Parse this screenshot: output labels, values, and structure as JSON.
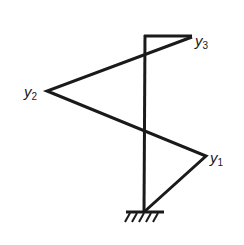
{
  "diagram": {
    "type": "mode-shape",
    "colors": {
      "stroke": "#1a1a1a",
      "background": "#ffffff"
    },
    "column": {
      "x": 145,
      "top": 35,
      "bottom": 212
    },
    "ground": {
      "y": 212,
      "x1": 126,
      "x2": 164
    },
    "nodes": [
      {
        "id": "y1",
        "label": "y",
        "subscript": "1",
        "x": 206,
        "y": 156
      },
      {
        "id": "y2",
        "label": "y",
        "subscript": "2",
        "x": 47,
        "y": 91
      },
      {
        "id": "y3",
        "label": "y",
        "subscript": "3",
        "x": 192,
        "y": 37
      }
    ]
  }
}
